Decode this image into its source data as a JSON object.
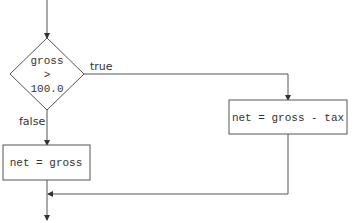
{
  "flowchart": {
    "decision": {
      "line1": "gross",
      "line2": ">",
      "line3": "100.0"
    },
    "branches": {
      "true_label": "true",
      "false_label": "false"
    },
    "true_box": {
      "text": "net = gross - tax"
    },
    "false_box": {
      "text": "net = gross"
    },
    "colors": {
      "stroke": "#555555",
      "text": "#333333",
      "background": "#ffffff"
    }
  }
}
